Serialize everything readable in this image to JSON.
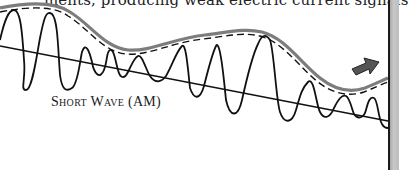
{
  "document": {
    "top_text_fragment": "ments, producing weak electric current signals",
    "figure": {
      "label": "Short Wave (AM)",
      "elements": {
        "envelope": "grey-solid-curve-with-dashed-outline",
        "carrier_wave": "amplitude-modulated-oscillation",
        "baseline": "straight-axis-line",
        "direction_indicator": "arrow-right-icon"
      },
      "colors": {
        "ink": "#111111",
        "envelope_grey": "#808080",
        "arrow_fill": "#555555",
        "page_edge": "#bdbdbd"
      }
    }
  }
}
